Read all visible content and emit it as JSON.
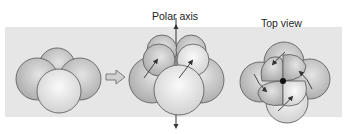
{
  "labels": {
    "polar_axis": "Polar axis",
    "top_view": "Top view"
  },
  "colors": {
    "background": "#ffffff",
    "panel": "#e6e6e6",
    "cell_fill_light": "#f2f2f2",
    "cell_fill_dark": "#b8b8b8",
    "outline": "#555555",
    "arrow": "#333333"
  },
  "figures": [
    {
      "id": "four-cell-stage",
      "description": "Four blastomeres clustered"
    },
    {
      "id": "eight-cell-side-view",
      "description": "Eight-cell stage with polar axis, arrows showing spiral rotation of upper tier"
    },
    {
      "id": "eight-cell-top-view",
      "description": "Top view showing upper tier cells offset clockwise from lower tier"
    }
  ]
}
